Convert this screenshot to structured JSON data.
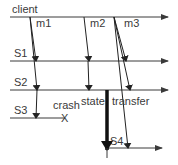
{
  "diagram": {
    "title": "",
    "colors": {
      "line": "#3a3a3a",
      "text": "#3a3a3a",
      "background": "#ffffff"
    },
    "timelines": [
      {
        "id": "client",
        "label": "client",
        "y": 17,
        "x1": 10,
        "x2": 168,
        "label_x": 12,
        "label_y": 12
      },
      {
        "id": "S1",
        "label": "S1",
        "y": 61,
        "x1": 10,
        "x2": 168,
        "label_x": 14,
        "label_y": 57
      },
      {
        "id": "S2",
        "label": "S2",
        "y": 90,
        "x1": 10,
        "x2": 168,
        "label_x": 14,
        "label_y": 86
      },
      {
        "id": "S3",
        "label": "S3",
        "y": 118,
        "x1": 10,
        "x2": 65,
        "label_x": 14,
        "label_y": 114
      },
      {
        "id": "S4",
        "label": "S4",
        "y": 148,
        "x1": 108,
        "x2": 162,
        "label_x": 110,
        "label_y": 146
      }
    ],
    "messages": [
      {
        "label": "m1",
        "label_x": 37,
        "label_y": 26,
        "targets": [
          "S1",
          "S2",
          "S3"
        ]
      },
      {
        "label": "m2",
        "label_x": 89,
        "label_y": 26,
        "targets": [
          "S1",
          "S2"
        ]
      },
      {
        "label": "m3",
        "label_x": 124,
        "label_y": 26,
        "targets": [
          "S1",
          "S2",
          "S4"
        ]
      }
    ],
    "events": {
      "crash": {
        "label": "crash",
        "mark": "X",
        "on": "S3",
        "label_x": 53,
        "label_y": 108
      },
      "state_transfer": {
        "label_part1": "state",
        "label_part2": "transfer",
        "from": "S2",
        "to": "S4"
      }
    }
  }
}
